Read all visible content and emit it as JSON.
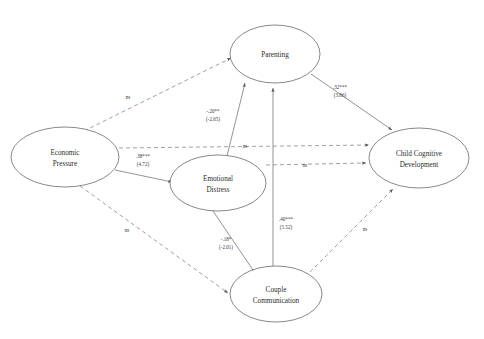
{
  "figure": {
    "type": "path-diagram",
    "background": "#ffffff",
    "line_color": "#666666",
    "node_stroke": "#555555"
  },
  "nodes": [
    {
      "id": "economic-pressure",
      "line1": "Economic",
      "line2": "Pressure",
      "cx": 65,
      "cy": 157,
      "rx": 54,
      "ry": 30
    },
    {
      "id": "emotional-distress",
      "line1": "Emotional",
      "line2": "Distress",
      "cx": 218,
      "cy": 183,
      "rx": 48,
      "ry": 28
    },
    {
      "id": "parenting",
      "line1": "Parenting",
      "line2": "",
      "cx": 275,
      "cy": 54,
      "rx": 45,
      "ry": 29
    },
    {
      "id": "couple-communication",
      "line1": "Couple",
      "line2": "Communication",
      "cx": 276,
      "cy": 294,
      "rx": 46,
      "ry": 28
    },
    {
      "id": "child-cognitive",
      "line1": "Child Cognitive",
      "line2": "Development",
      "cx": 419,
      "cy": 158,
      "rx": 50,
      "ry": 30
    }
  ],
  "edges": [
    {
      "id": "ep-to-parenting",
      "from": "economic-pressure",
      "to": "parenting",
      "style": "dashed",
      "coef": "ns",
      "tvalue": "",
      "significant": false
    },
    {
      "id": "ep-to-ccd",
      "from": "economic-pressure",
      "to": "child-cognitive",
      "style": "dashed",
      "coef": "ns",
      "tvalue": "",
      "significant": false
    },
    {
      "id": "ep-to-emotional",
      "from": "economic-pressure",
      "to": "emotional-distress",
      "style": "solid",
      "coef": ".38***",
      "tvalue": "(4.72)",
      "significant": true
    },
    {
      "id": "ep-to-couple",
      "from": "economic-pressure",
      "to": "couple-communication",
      "style": "dashed",
      "coef": "ns",
      "tvalue": "",
      "significant": false
    },
    {
      "id": "emotional-to-parenting",
      "from": "emotional-distress",
      "to": "parenting",
      "style": "solid",
      "coef": "-.20**",
      "tvalue": "(-2.65)",
      "significant": true
    },
    {
      "id": "emotional-to-ccd",
      "from": "emotional-distress",
      "to": "child-cognitive",
      "style": "dashed",
      "coef": "ns",
      "tvalue": "",
      "significant": false
    },
    {
      "id": "emotional-to-couple",
      "from": "emotional-distress",
      "to": "couple-communication",
      "style": "solid",
      "coef": "-.18*",
      "tvalue": "(-2.01)",
      "significant": true
    },
    {
      "id": "couple-to-parenting",
      "from": "couple-communication",
      "to": "parenting",
      "style": "solid",
      "coef": ".40***",
      "tvalue": "(5.52)",
      "significant": true
    },
    {
      "id": "couple-to-ccd",
      "from": "couple-communication",
      "to": "child-cognitive",
      "style": "dashed",
      "coef": "ns",
      "tvalue": "",
      "significant": false
    },
    {
      "id": "parenting-to-ccd",
      "from": "parenting",
      "to": "child-cognitive",
      "style": "solid",
      "coef": ".32***",
      "tvalue": "(3.86)",
      "significant": true
    }
  ],
  "labels": {
    "ep_parenting_ns": "ns",
    "ep_ccd_ns": "ns",
    "ep_couple_ns": "ns",
    "emotional_ccd_ns": "ns",
    "couple_ccd_ns": "ns",
    "ep_emotional_coef": ".38***",
    "ep_emotional_t": "(4.72)",
    "emotional_parenting_coef": "-.20**",
    "emotional_parenting_t": "(-2.65)",
    "emotional_couple_coef": "-.18*",
    "emotional_couple_t": "(-2.01)",
    "couple_parenting_coef": ".40***",
    "couple_parenting_t": "(5.52)",
    "parenting_ccd_coef": ".32***",
    "parenting_ccd_t": "(3.86)"
  },
  "node_text": {
    "economic_l1": "Economic",
    "economic_l2": "Pressure",
    "emotional_l1": "Emotional",
    "emotional_l2": "Distress",
    "parenting_l1": "Parenting",
    "couple_l1": "Couple",
    "couple_l2": "Communication",
    "child_l1": "Child Cognitive",
    "child_l2": "Development"
  }
}
